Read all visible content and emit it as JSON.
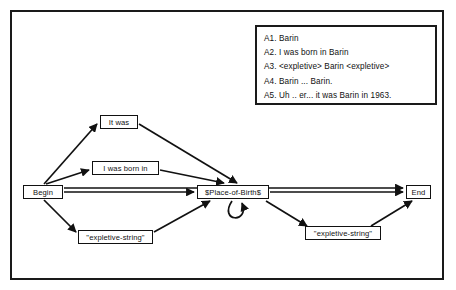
{
  "figure": {
    "answers_panel": {
      "lines": [
        "A1. Barin",
        "A2. I was born in Barin",
        "A3. <expletive> Barin <expletive>",
        "A4. Barin ... Barin.",
        "A5. Uh .. er... it was Barin in 1963."
      ]
    },
    "graph": {
      "nodes": [
        {
          "id": "begin",
          "label": "Begin"
        },
        {
          "id": "itwas",
          "label": "It was"
        },
        {
          "id": "iwasbornin",
          "label": "I was born in"
        },
        {
          "id": "expletive_left",
          "label": "\"expletive-string\""
        },
        {
          "id": "place",
          "label": "$Place-of-Birth$"
        },
        {
          "id": "expletive_right",
          "label": "\"expletive-string\""
        },
        {
          "id": "end",
          "label": "End"
        }
      ]
    },
    "colors": {
      "frame": "#1a1a1a",
      "node_border": "#111111",
      "edge": "#111111",
      "background": "#ffffff",
      "text": "#111111"
    }
  }
}
